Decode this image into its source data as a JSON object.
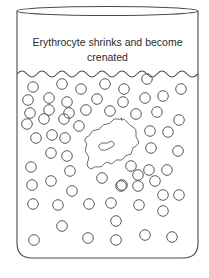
{
  "diagram": {
    "label_line1": "Erythrocyte shrinks and become",
    "label_line2": "crenated",
    "colors": {
      "stroke": "#4a4a4a",
      "cell_stroke": "#5a5a5a",
      "background": "#ffffff"
    },
    "components": [
      "beaker",
      "liquid-surface",
      "solute-particles",
      "crenated-erythrocyte"
    ]
  }
}
